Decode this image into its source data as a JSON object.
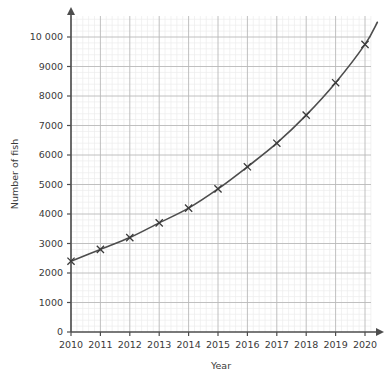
{
  "chart_data": {
    "type": "line",
    "title": "",
    "xlabel": "Year",
    "ylabel": "Number of fish",
    "categories": [
      2010,
      2011,
      2012,
      2013,
      2014,
      2015,
      2016,
      2017,
      2018,
      2019,
      2020
    ],
    "values": [
      2400,
      2800,
      3200,
      3700,
      4200,
      4850,
      5600,
      6400,
      7350,
      8450,
      9750
    ],
    "x": [
      2010,
      2011,
      2012,
      2013,
      2014,
      2015,
      2016,
      2017,
      2018,
      2019,
      2020
    ],
    "xlim": [
      2010,
      2020.6
    ],
    "ylim": [
      0,
      10800
    ],
    "xticks": [
      2010,
      2011,
      2012,
      2013,
      2014,
      2015,
      2016,
      2017,
      2018,
      2019,
      2020
    ],
    "xtick_labels": [
      "2010",
      "2011",
      "2012",
      "2013",
      "2014",
      "2015",
      "2016",
      "2017",
      "2018",
      "2019",
      "2020"
    ],
    "yticks": [
      0,
      1000,
      2000,
      3000,
      4000,
      5000,
      6000,
      7000,
      8000,
      9000,
      10000
    ],
    "ytick_labels": [
      "0",
      "1000",
      "2000",
      "3000",
      "4000",
      "5000",
      "6000",
      "7000",
      "8000",
      "9000",
      "10 000"
    ],
    "grid": true,
    "minor_grid": true,
    "minor_divisions": 5,
    "legend": null,
    "marker": "x",
    "line_color": "#4d4d4d",
    "marker_color": "#3a3a3a",
    "major_grid_color": "#b9b9b9",
    "minor_grid_color": "#ececec",
    "axis_color": "#4d4d4d",
    "background": "#ffffff",
    "curve_extends_beyond_last_point": true,
    "curve_end_value": 10500
  },
  "axes": {
    "y_axis_title": "Number of fish",
    "x_axis_title": "Year"
  },
  "icons": {
    "x_arrow": "arrow-right-icon",
    "y_arrow": "arrow-up-icon"
  }
}
